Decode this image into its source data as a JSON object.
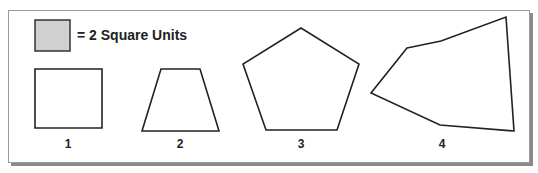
{
  "legend": {
    "swatch_color": "#d0d0d0",
    "text": "= 2 Square Units"
  },
  "shapes": [
    {
      "label": "1",
      "name": "square",
      "points": "35,69 102,69 102,128 35,128"
    },
    {
      "label": "2",
      "name": "trapezoid",
      "points": "161,69 200,69 219,131 142,131"
    },
    {
      "label": "3",
      "name": "pentagon",
      "points": "301,28 359,64 337,130 266,130 243,64"
    },
    {
      "label": "4",
      "name": "irregular-hexagon",
      "points": "407,48 441,41 506,17 514,131 440,125 371,93"
    }
  ],
  "colors": {
    "stroke": "#222222",
    "frame_border": "#9a9a9a",
    "frame_shadow": "#8a8a8a"
  }
}
